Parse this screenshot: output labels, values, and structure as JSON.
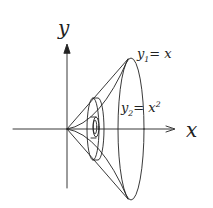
{
  "diagram": {
    "axes": {
      "x_label": "x",
      "y_label": "y"
    },
    "curves": [
      {
        "name": "y1",
        "label_var": "y",
        "label_sub": "1",
        "label_rhs": "= x"
      },
      {
        "name": "y2",
        "label_var": "y",
        "label_sub": "2",
        "label_rhs": "= x",
        "label_sup": "2"
      }
    ],
    "stroke_color": "#222222",
    "background": "#ffffff"
  }
}
